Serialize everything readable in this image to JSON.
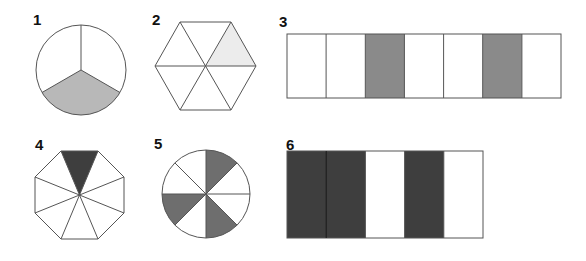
{
  "colors": {
    "stroke": "#555555",
    "empty": "#ffffff",
    "light_gray": "#b8b8b8",
    "very_light_gray": "#ececec",
    "medium_gray": "#8a8a8a",
    "dark_gray": "#3e3e3e",
    "mid_dark_gray": "#6e6e6e"
  },
  "figures": [
    {
      "label": "1",
      "shape": "circle",
      "parts": 3,
      "shaded_parts": [
        1
      ],
      "shaded_count": 1,
      "fraction": "1/3",
      "fill": "#b8b8b8"
    },
    {
      "label": "2",
      "shape": "hexagon",
      "parts": 6,
      "shaded_parts": [
        1
      ],
      "shaded_count": 1,
      "fraction": "1/6",
      "fill": "#ececec"
    },
    {
      "label": "3",
      "shape": "rectangle",
      "parts": 7,
      "shaded_parts": [
        2,
        5
      ],
      "shaded_count": 2,
      "fraction": "2/7",
      "fill": "#8a8a8a"
    },
    {
      "label": "4",
      "shape": "octagon",
      "parts": 8,
      "shaded_parts": [
        0
      ],
      "shaded_count": 1,
      "fraction": "1/8",
      "fill": "#3e3e3e"
    },
    {
      "label": "5",
      "shape": "circle",
      "parts": 8,
      "shaded_parts": [
        0,
        3,
        5
      ],
      "shaded_count": 3,
      "fraction": "3/8",
      "fill": "#6e6e6e"
    },
    {
      "label": "6",
      "shape": "rectangle",
      "parts": 5,
      "shaded_parts": [
        0,
        1,
        3
      ],
      "shaded_count": 3,
      "fraction": "3/5",
      "fill": "#3e3e3e"
    }
  ]
}
